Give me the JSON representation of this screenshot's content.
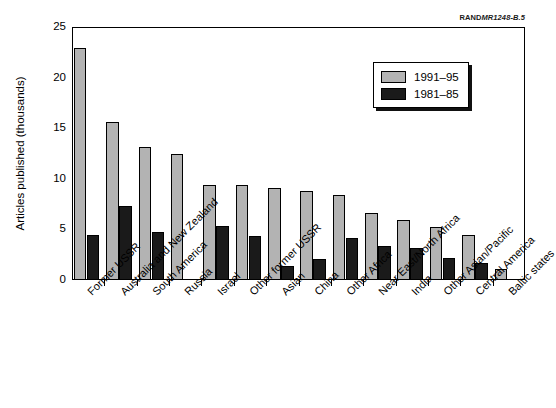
{
  "source_credit": {
    "mark": "RAND",
    "document": "MR1248-B.5"
  },
  "legend": {
    "position": "top-right-inside",
    "entries": [
      {
        "label": "1991–95",
        "color": "#b3b3b3"
      },
      {
        "label": "1981–85",
        "color": "#1a1a1a"
      }
    ]
  },
  "chart_data": {
    "type": "bar",
    "title": "",
    "xlabel": "",
    "ylabel": "Articles published (thousands)",
    "ylim": [
      0,
      25
    ],
    "yticks": [
      0,
      5,
      10,
      15,
      20,
      25
    ],
    "ytick_labels": [
      "0",
      "5",
      "10",
      "15",
      "20",
      "25"
    ],
    "grid": false,
    "legend_position": "upper right",
    "categories": [
      "Former USSR",
      "Australia and New Zealand",
      "South America",
      "Russia",
      "Israel",
      "Other former USSR",
      "Asian",
      "China",
      "Other Africa",
      "Near East/North Africa",
      "India",
      "Other Asian/Pacific",
      "Central America",
      "Baltic states"
    ],
    "series": [
      {
        "name": "1991–95",
        "color": "#b3b3b3",
        "values": [
          22.9,
          15.6,
          13.1,
          12.5,
          9.4,
          9.4,
          9.1,
          8.8,
          8.4,
          6.6,
          5.9,
          5.2,
          4.4,
          1.1
        ]
      },
      {
        "name": "1981–85",
        "color": "#1a1a1a",
        "values": [
          4.4,
          7.3,
          4.7,
          null,
          5.3,
          4.3,
          1.4,
          2.1,
          4.2,
          3.4,
          3.2,
          2.2,
          1.7,
          null
        ]
      }
    ]
  }
}
